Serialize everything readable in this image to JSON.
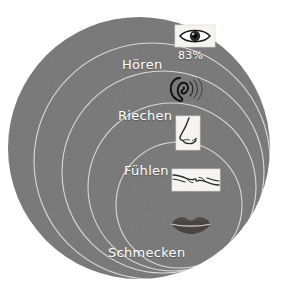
{
  "diagram": {
    "type": "nested-circles",
    "background_color": "#ffffff",
    "fill_color": "#7d7d7d",
    "arc_color": "#d7d7d7",
    "label_color": "#ffffff",
    "rings": [
      {
        "id": "sehen",
        "label": "",
        "value_label": "83%",
        "icon": "eye-icon",
        "icon_boxed": true,
        "cx": 139,
        "cy": 148,
        "r": 131
      },
      {
        "id": "hoeren",
        "label": "Hören",
        "value_label": "",
        "icon": "ear-icon",
        "icon_boxed": false,
        "cx": 152,
        "cy": 161,
        "r": 118
      },
      {
        "id": "riechen",
        "label": "Riechen",
        "value_label": "",
        "icon": "nose-icon",
        "icon_boxed": true,
        "cx": 163,
        "cy": 172,
        "r": 101
      },
      {
        "id": "fuehlen",
        "label": "Fühlen",
        "value_label": "",
        "icon": "hands-icon",
        "icon_boxed": true,
        "cx": 172,
        "cy": 187,
        "r": 84
      },
      {
        "id": "schmecken",
        "label": "Schmecken",
        "value_label": "",
        "icon": "lips-icon",
        "icon_boxed": false,
        "cx": 179,
        "cy": 205,
        "r": 63
      }
    ],
    "labels": {
      "hoeren": "Hören",
      "riechen": "Riechen",
      "fuehlen": "Fühlen",
      "schmecken": "Schmecken",
      "sehen_percent": "83%"
    }
  }
}
